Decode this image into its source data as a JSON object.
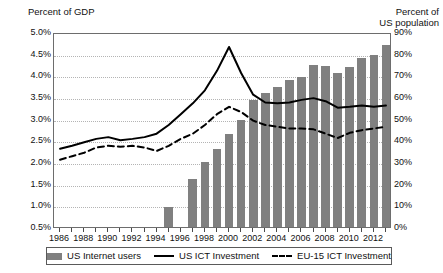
{
  "chart_data": {
    "type": "bar",
    "title": "",
    "xlabel": "",
    "ylabel": "Percent of GDP",
    "y2label": "Percent of US population",
    "ylim": [
      0.5,
      5.0
    ],
    "y2lim": [
      0,
      90
    ],
    "grid": true,
    "legend_position": "bottom",
    "x": [
      1986,
      1987,
      1988,
      1989,
      1990,
      1991,
      1992,
      1993,
      1994,
      1995,
      1996,
      1997,
      1998,
      1999,
      2000,
      2001,
      2002,
      2003,
      2004,
      2005,
      2006,
      2007,
      2008,
      2009,
      2010,
      2011,
      2012,
      2013
    ],
    "xtick_labels": [
      "1986",
      "1988",
      "1990",
      "1992",
      "1994",
      "1996",
      "1998",
      "2000",
      "2002",
      "2004",
      "2006",
      "2008",
      "2010",
      "2012"
    ],
    "ytick_labels_left": [
      "5.0%",
      "4.5%",
      "4.0%",
      "3.5%",
      "3.0%",
      "2.5%",
      "2.0%",
      "1.5%",
      "1.0%",
      "0.5%"
    ],
    "ytick_labels_right": [
      "90%",
      "80%",
      "70%",
      "60%",
      "50%",
      "40%",
      "30%",
      "20%",
      "10%",
      "0%"
    ],
    "series": [
      {
        "name": "US Internet users",
        "type": "bar",
        "axis": "right",
        "color": "#808080",
        "unit": "percent of US population",
        "values": [
          0,
          0,
          0,
          0,
          0,
          0,
          0,
          0,
          0,
          9.2,
          0,
          22.2,
          30.1,
          35.9,
          43.1,
          49.2,
          58.8,
          61.7,
          64.8,
          68.0,
          69.1,
          75.0,
          74.2,
          71.0,
          74.0,
          77.9,
          79.3,
          84.2
        ]
      },
      {
        "name": "US ICT Investment",
        "type": "line",
        "style": "solid",
        "axis": "left",
        "color": "#000000",
        "unit": "percent of GDP",
        "values": [
          2.35,
          2.42,
          2.5,
          2.58,
          2.62,
          2.55,
          2.58,
          2.62,
          2.7,
          2.9,
          3.15,
          3.4,
          3.7,
          4.15,
          4.7,
          4.1,
          3.6,
          3.42,
          3.4,
          3.42,
          3.48,
          3.52,
          3.45,
          3.3,
          3.32,
          3.35,
          3.32,
          3.35
        ]
      },
      {
        "name": "EU-15 ICT Investment",
        "type": "line",
        "style": "dashed",
        "axis": "left",
        "color": "#000000",
        "unit": "percent of GDP",
        "values": [
          2.1,
          2.18,
          2.26,
          2.38,
          2.42,
          2.4,
          2.42,
          2.38,
          2.3,
          2.42,
          2.58,
          2.7,
          2.9,
          3.15,
          3.32,
          3.2,
          3.0,
          2.9,
          2.86,
          2.82,
          2.82,
          2.8,
          2.7,
          2.6,
          2.72,
          2.78,
          2.82,
          2.86
        ]
      }
    ],
    "legend": [
      {
        "label": "US Internet users",
        "marker": "bar-swatch"
      },
      {
        "label": "US ICT Investment",
        "marker": "solid-line"
      },
      {
        "label": "EU-15 ICT Investment",
        "marker": "dashed-line"
      }
    ],
    "axis_titles": {
      "left": "Percent of GDP",
      "right": "Percent of\nUS population"
    }
  }
}
